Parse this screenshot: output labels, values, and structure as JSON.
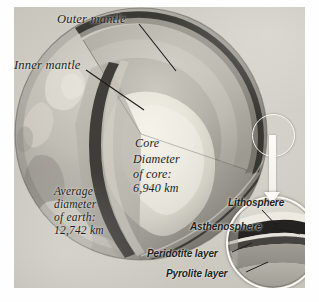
{
  "figure": {
    "style": "grayscale-sepia photographic illustration"
  },
  "labels": {
    "outer_mantle": "Outer mantle",
    "inner_mantle": "Inner mantle",
    "core": "Core",
    "core_diameter_line1": "Diameter",
    "core_diameter_line2": "of core:",
    "core_diameter_line3": "6,940 km",
    "avg_line1": "Average",
    "avg_line2": "diameter",
    "avg_line3": "of earth:",
    "avg_line4": "12,742 km",
    "lithosphere": "Lithosphere",
    "asthenosphere": "Asthenosphere",
    "peridotite": "Peridotite layer",
    "pyrolite": "Pyrolite layer"
  },
  "measurements": {
    "core_diameter_km": "6,940 km",
    "earth_average_diameter_km": "12,742 km"
  },
  "inset": {
    "name": "crust-magnifier-inset",
    "bands": [
      "Lithosphere",
      "Asthenosphere",
      "Peridotite layer",
      "Pyrolite layer"
    ]
  },
  "colors": {
    "plate_background": "#cfccc4",
    "globe_light": "#cdcac2",
    "globe_dark": "#8e8b84",
    "core_highlight": "#efece2",
    "dark_band": "#2b2a27",
    "label_text": "#211f1c",
    "inset_stroke": "#fbfaf6"
  }
}
